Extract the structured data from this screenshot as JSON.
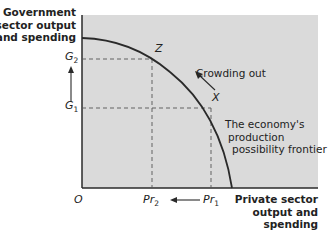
{
  "diagram": {
    "y_axis_title": [
      "Government",
      "sector output",
      "and spending"
    ],
    "x_axis_title": [
      "Private sector",
      "output and",
      "spending"
    ],
    "origin_label": "O",
    "y_ticks": [
      {
        "base": "G",
        "sub": "2"
      },
      {
        "base": "G",
        "sub": "1"
      }
    ],
    "x_ticks": [
      {
        "base": "Pr",
        "sub": "2"
      },
      {
        "base": "Pr",
        "sub": "1"
      }
    ],
    "points": {
      "z": "Z",
      "x": "X"
    },
    "annotations": {
      "crowding_out": "Crowding out",
      "frontier": [
        "The economy's",
        "production",
        "possibility frontier"
      ]
    },
    "colors": {
      "plot_fill": "#dadada",
      "axis": "#2a2a2a",
      "curve": "#2a2a2a",
      "dashed": "#555555"
    }
  }
}
